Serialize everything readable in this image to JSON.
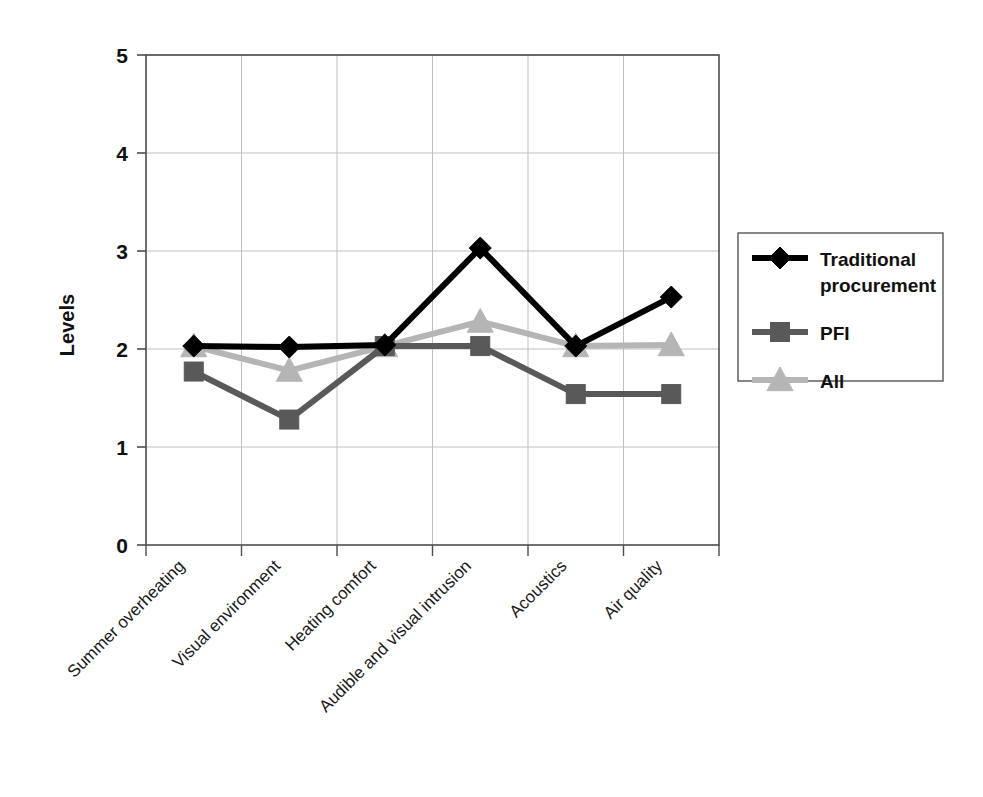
{
  "chart_data": {
    "type": "line",
    "title": "",
    "xlabel": "",
    "ylabel": "Levels",
    "ylim": [
      0,
      5
    ],
    "yticks": [
      0,
      1,
      2,
      3,
      4,
      5
    ],
    "grid": true,
    "legend_position": "right",
    "categories": [
      "Summer overheating",
      "Visual environment",
      "Heating comfort",
      "Audible and visual intrusion",
      "Acoustics",
      "Air quality"
    ],
    "series": [
      {
        "name": "Traditional procurement",
        "marker": "diamond",
        "color": "#000000",
        "values": [
          2.03,
          2.02,
          2.04,
          3.03,
          2.03,
          2.53
        ]
      },
      {
        "name": "PFI",
        "marker": "square",
        "color": "#595959",
        "values": [
          1.77,
          1.28,
          2.03,
          2.03,
          1.54,
          1.54
        ]
      },
      {
        "name": "All",
        "marker": "triangle",
        "color": "#b5b5b5",
        "values": [
          2.03,
          1.78,
          2.03,
          2.28,
          2.03,
          2.04
        ]
      }
    ]
  },
  "axis": {
    "y_tick_labels": [
      "0",
      "1",
      "2",
      "3",
      "4",
      "5"
    ],
    "y_title": "Levels"
  },
  "legend": {
    "entries": [
      {
        "label": "Traditional procurement",
        "marker": "diamond",
        "color": "#000000"
      },
      {
        "label": "PFI",
        "marker": "square",
        "color": "#595959"
      },
      {
        "label": "All",
        "marker": "triangle",
        "color": "#b5b5b5"
      }
    ]
  },
  "colors": {
    "series_traditional": "#000000",
    "series_pfi": "#595959",
    "series_all": "#b5b5b5",
    "axis": "#4d4d4d",
    "grid": "#bfbfbf",
    "background": "#ffffff"
  }
}
